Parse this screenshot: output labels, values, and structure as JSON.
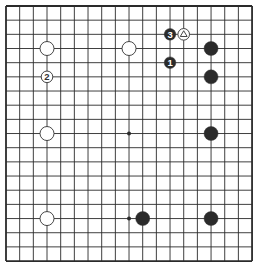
{
  "board": {
    "size": 19,
    "origin": {
      "x": 6,
      "y": 6
    },
    "spacing": {
      "x": 13.67,
      "y": 14.17
    },
    "line_color": "#2a2a2a",
    "border_width": 1.8,
    "line_width": 0.9,
    "background": "#ffffff"
  },
  "hoshi": [
    {
      "col": 9,
      "row": 9
    },
    {
      "col": 9,
      "row": 15
    }
  ],
  "stones": [
    {
      "color": "white",
      "col": 3,
      "row": 3,
      "label": "",
      "size": "large"
    },
    {
      "color": "white",
      "col": 9,
      "row": 3,
      "label": "",
      "size": "large"
    },
    {
      "color": "white",
      "col": 3,
      "row": 9,
      "label": "",
      "size": "large"
    },
    {
      "color": "white",
      "col": 3,
      "row": 15,
      "label": "",
      "size": "large"
    },
    {
      "color": "white",
      "col": 3,
      "row": 5,
      "label": "2",
      "size": "small"
    },
    {
      "color": "white",
      "col": 13,
      "row": 2,
      "label": "△",
      "size": "small",
      "mark": "triangle"
    },
    {
      "color": "black",
      "col": 12,
      "row": 2,
      "label": "3",
      "size": "small"
    },
    {
      "color": "black",
      "col": 12,
      "row": 4,
      "label": "1",
      "size": "small"
    },
    {
      "color": "black",
      "col": 15,
      "row": 3,
      "label": "",
      "size": "large"
    },
    {
      "color": "black",
      "col": 15,
      "row": 5,
      "label": "",
      "size": "large"
    },
    {
      "color": "black",
      "col": 15,
      "row": 9,
      "label": "",
      "size": "large"
    },
    {
      "color": "black",
      "col": 10,
      "row": 15,
      "label": "",
      "size": "large"
    },
    {
      "color": "black",
      "col": 15,
      "row": 15,
      "label": "",
      "size": "large"
    }
  ],
  "colors": {
    "black_stone": "#2b2b2b",
    "white_stone": "#ffffff",
    "stone_outline": "#333333",
    "black_label": "#ffffff",
    "white_label": "#333333"
  }
}
